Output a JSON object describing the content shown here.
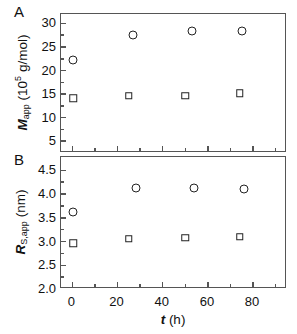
{
  "figure": {
    "panel_a_letter": "A",
    "panel_b_letter": "B",
    "xlabel_plain": "t (h)"
  },
  "chart_data": [
    {
      "type": "scatter",
      "panel": "A",
      "title": "",
      "xlabel": "t (h)",
      "ylabel": "M_app (10^5 g/mol)",
      "xlim": [
        -5,
        95
      ],
      "ylim": [
        2.5,
        32
      ],
      "xticks": [
        0,
        20,
        40,
        60,
        80
      ],
      "xticklabels": [
        "0",
        "20",
        "40",
        "60",
        "80"
      ],
      "xminorticks": [
        10,
        30,
        50,
        70,
        90
      ],
      "yticks": [
        5,
        10,
        15,
        20,
        25,
        30
      ],
      "yticklabels": [
        "5",
        "10",
        "15",
        "20",
        "25",
        "30"
      ],
      "grid": false,
      "legend": "none",
      "series": [
        {
          "name": "circles",
          "marker": "open-circle",
          "points": [
            {
              "x": 0.5,
              "y": 22.3
            },
            {
              "x": 27.0,
              "y": 27.5
            },
            {
              "x": 53.0,
              "y": 28.4
            },
            {
              "x": 75.0,
              "y": 28.4
            }
          ]
        },
        {
          "name": "squares",
          "marker": "open-square",
          "points": [
            {
              "x": 0.5,
              "y": 14.1
            },
            {
              "x": 25.0,
              "y": 14.7
            },
            {
              "x": 50.0,
              "y": 14.7
            },
            {
              "x": 74.0,
              "y": 15.2
            }
          ]
        }
      ]
    },
    {
      "type": "scatter",
      "panel": "B",
      "title": "",
      "xlabel": "t (h)",
      "ylabel": "R_S,app (nm)",
      "xlim": [
        -5,
        95
      ],
      "ylim": [
        2.0,
        4.78
      ],
      "xticks": [
        0,
        20,
        40,
        60,
        80
      ],
      "xticklabels": [
        "0",
        "20",
        "40",
        "60",
        "80"
      ],
      "xminorticks": [
        10,
        30,
        50,
        70,
        90
      ],
      "yticks": [
        2.0,
        2.5,
        3.0,
        3.5,
        4.0,
        4.5
      ],
      "yticklabels": [
        "2.0",
        "2.5",
        "3.0",
        "3.5",
        "4.0",
        "4.5"
      ],
      "grid": false,
      "legend": "none",
      "series": [
        {
          "name": "circles",
          "marker": "open-circle",
          "points": [
            {
              "x": 0.5,
              "y": 3.62
            },
            {
              "x": 28.0,
              "y": 4.13
            },
            {
              "x": 54.0,
              "y": 4.12
            },
            {
              "x": 76.0,
              "y": 4.1
            }
          ]
        },
        {
          "name": "squares",
          "marker": "open-square",
          "points": [
            {
              "x": 0.5,
              "y": 2.96
            },
            {
              "x": 25.0,
              "y": 3.06
            },
            {
              "x": 50.0,
              "y": 3.08
            },
            {
              "x": 74.0,
              "y": 3.1
            }
          ]
        }
      ]
    }
  ]
}
